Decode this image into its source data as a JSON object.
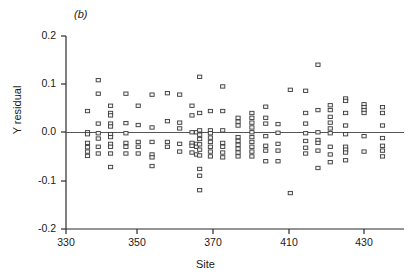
{
  "figure": {
    "panel_label": "(b)",
    "background": "#ffffff",
    "ink_color": "#1a1a1a"
  },
  "chart_data": {
    "type": "scatter",
    "title": "",
    "panel": "(b)",
    "xlabel": "Site",
    "ylabel": "Y residual",
    "xlim": [
      327,
      437
    ],
    "ylim": [
      -0.2,
      0.2
    ],
    "grid": false,
    "legend": null,
    "reference_line": {
      "y": 0.0,
      "color": "#555555"
    },
    "xticks": [
      330,
      350,
      370,
      410,
      430
    ],
    "xtick_labels": [
      "330",
      "350",
      "370",
      "410",
      "430"
    ],
    "yticks": [
      0.2,
      0.1,
      0.0,
      -0.1,
      -0.2
    ],
    "ytick_labels": [
      "0.2",
      "0.1",
      "0.0",
      "-0.1",
      "-0.2"
    ],
    "marker": {
      "shape": "open-square",
      "size": 4.2,
      "fill": "#f2f2f2",
      "edge": "#3a3a3a"
    },
    "columns": [
      {
        "x": 334,
        "values": [
          0.044,
          0.0,
          -0.004,
          -0.022,
          -0.031,
          -0.04,
          -0.049
        ]
      },
      {
        "x": 337.5,
        "values": [
          0.108,
          0.08,
          0.018,
          -0.002,
          -0.013,
          -0.03,
          -0.044
        ]
      },
      {
        "x": 341.5,
        "values": [
          0.055,
          0.04,
          0.035,
          0.018,
          0.012,
          -0.004,
          -0.01,
          -0.024,
          -0.03,
          -0.044,
          -0.072
        ]
      },
      {
        "x": 346.5,
        "values": [
          0.08,
          0.019,
          -0.002,
          -0.022,
          -0.03,
          -0.044
        ]
      },
      {
        "x": 350.5,
        "values": [
          0.055,
          0.015,
          -0.02,
          -0.03,
          -0.044
        ]
      },
      {
        "x": 355,
        "values": [
          0.078,
          0.01,
          -0.02,
          -0.046,
          -0.052,
          -0.07
        ]
      },
      {
        "x": 360,
        "values": [
          0.081,
          0.023,
          -0.02,
          -0.03
        ]
      },
      {
        "x": 364,
        "values": [
          0.078,
          0.02,
          0.008,
          -0.024,
          -0.04
        ]
      },
      {
        "x": 368,
        "values": [
          0.055,
          0.035,
          0.0,
          -0.022,
          -0.028,
          -0.042
        ]
      },
      {
        "x": 369.5,
        "values": [
          0.0,
          -0.024,
          -0.03,
          -0.046
        ]
      },
      {
        "x": 370.5,
        "values": [
          0.115,
          0.04,
          0.004,
          -0.005,
          -0.014,
          -0.025,
          -0.036,
          -0.048,
          -0.076,
          -0.09,
          -0.12
        ]
      },
      {
        "x": 374,
        "values": [
          0.044,
          0.004,
          -0.002,
          -0.011,
          -0.02,
          -0.03,
          -0.04,
          -0.05
        ]
      },
      {
        "x": 378,
        "values": [
          0.095,
          0.044,
          0.004,
          -0.022,
          -0.03,
          -0.042,
          -0.052
        ]
      },
      {
        "x": 383,
        "values": [
          0.03,
          0.022,
          0.014,
          -0.01,
          -0.018,
          -0.026,
          -0.034,
          -0.042,
          -0.05
        ]
      },
      {
        "x": 387.5,
        "values": [
          0.04,
          0.03,
          0.02,
          0.01,
          0.0,
          -0.01,
          -0.02,
          -0.03,
          -0.04,
          -0.05
        ]
      },
      {
        "x": 392,
        "values": [
          0.053,
          0.03,
          0.018,
          -0.008,
          -0.028,
          -0.038,
          -0.06
        ]
      },
      {
        "x": 396,
        "values": [
          0.017,
          -0.001,
          -0.024,
          -0.038,
          -0.06
        ]
      },
      {
        "x": 400,
        "values": [
          0.088,
          -0.126
        ]
      },
      {
        "x": 405,
        "values": [
          0.086,
          0.04,
          0.018,
          -0.002,
          -0.018,
          -0.032,
          -0.044
        ]
      },
      {
        "x": 409,
        "values": [
          0.14,
          0.046,
          0.0,
          -0.016,
          -0.022,
          -0.038,
          -0.074
        ]
      },
      {
        "x": 413,
        "values": [
          0.056,
          0.046,
          0.032,
          0.02,
          0.008,
          -0.002,
          -0.03,
          -0.046,
          -0.062
        ]
      },
      {
        "x": 418,
        "values": [
          0.07,
          0.065,
          0.04,
          0.014,
          -0.004,
          -0.03,
          -0.036,
          -0.042,
          -0.058
        ]
      },
      {
        "x": 424,
        "values": [
          0.058,
          0.052,
          0.046,
          0.04,
          -0.008,
          -0.04
        ]
      },
      {
        "x": 430,
        "values": [
          0.052,
          0.04,
          0.014,
          -0.012,
          -0.028,
          -0.038,
          -0.05
        ]
      }
    ]
  },
  "axis_geometry": {
    "plot_left_px": 66,
    "plot_right_px": 404,
    "plot_top_px": 36,
    "plot_bottom_px": 229,
    "x_tick_px": [
      66,
      137,
      213,
      289,
      364
    ],
    "y_tick_px": [
      36,
      84,
      132,
      181,
      229
    ]
  }
}
